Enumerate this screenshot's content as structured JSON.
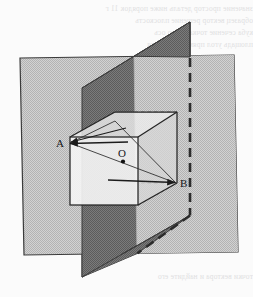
{
  "figure": {
    "caption_visible": false,
    "labels": {
      "vertex_a": "A",
      "vertex_b": "B",
      "center_o": "O"
    },
    "colors": {
      "background": "#fbfbfb",
      "light_plane_fill": "#c6c6c6",
      "light_plane_stroke": "#3b3b3b",
      "dark_plane_fill": "#6f6f6f",
      "dark_plane_stroke": "#3b3b3b",
      "cube_stroke": "#2b2b2b",
      "cube_face_fill": "#f2f2f2",
      "hidden_edge_stroke": "#6a6a6a",
      "arrow_stroke": "#1c1c1c",
      "bleed_text": "#c9c9cb"
    },
    "geometry": {
      "light_plane_quad": [
        [
          20,
          58
        ],
        [
          234,
          55
        ],
        [
          238,
          252
        ],
        [
          24,
          255
        ]
      ],
      "dark_plane_quad": [
        [
          82,
          88
        ],
        [
          190,
          22
        ],
        [
          190,
          215
        ],
        [
          82,
          277
        ]
      ],
      "dashed_vertical_line": [
        [
          190,
          58
        ],
        [
          190,
          215
        ]
      ],
      "dashed_diagonal_line": [
        [
          190,
          215
        ],
        [
          112,
          256
        ]
      ],
      "cube_front_face": [
        [
          70,
          137
        ],
        [
          138,
          137
        ],
        [
          138,
          205
        ],
        [
          70,
          205
        ]
      ],
      "cube_back_face": [
        [
          115,
          112
        ],
        [
          177,
          112
        ],
        [
          177,
          183
        ],
        [
          115,
          183
        ]
      ],
      "arrow_a_tip": [
        68,
        145
      ],
      "arrow_b_tip": [
        176,
        183
      ],
      "center_point": [
        121,
        160
      ]
    },
    "elements": {
      "light_plane_name": "light-gray-plane",
      "dark_plane_name": "dark-gray-plane",
      "cube_name": "cube",
      "arrow_a_name": "arrow-to-a",
      "arrow_b_name": "arrow-to-b"
    }
  },
  "bleed_through_text": {
    "line1": "значение простор деталь ниже порядок 11 г",
    "line2": "образец вектор решение плоскость",
    "line3": "куба сечение точка ребро ось",
    "line4": "площадь угол прямая проекция",
    "line5": "точки вектора и найдите его"
  }
}
